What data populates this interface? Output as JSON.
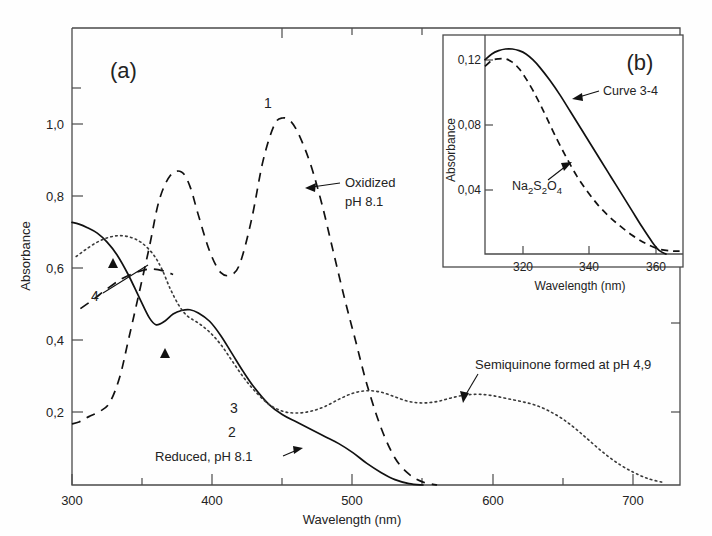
{
  "figure": {
    "panel_a_label": "(a)",
    "panel_b_label": "(b)"
  },
  "panel_a": {
    "xlabel": "Wavelength (nm)",
    "ylabel": "Absorbance",
    "xticks": [
      "300",
      "400",
      "500",
      "600",
      "700"
    ],
    "xtick_values": [
      300,
      400,
      500,
      600,
      700
    ],
    "xminor_values": [
      350,
      450,
      550,
      650
    ],
    "yticks": [
      "0,2",
      "0,4",
      "0,6",
      "0,8",
      "1,0"
    ],
    "ytick_values": [
      0.2,
      0.4,
      0.6,
      0.8,
      1.0
    ],
    "yminor_values": [
      1.1,
      1.2
    ],
    "xlim": [
      300,
      733
    ],
    "ylim": [
      0,
      1.27
    ],
    "annotations": [
      {
        "name": "oxidized",
        "line1": "Oxidized",
        "line2": "pH 8.1"
      },
      {
        "name": "semiquinone",
        "text": "Semiquinone formed at pH 4,9"
      },
      {
        "name": "reduced",
        "text": "Reduced, pH 8.1"
      }
    ],
    "curve_numbers": [
      "1",
      "2",
      "3",
      "4"
    ]
  },
  "panel_b": {
    "xlabel": "Wavelength (nm)",
    "ylabel": "Absorbance",
    "xticks": [
      "320",
      "340",
      "360"
    ],
    "xtick_values": [
      320,
      340,
      360
    ],
    "yticks": [
      "0,04",
      "0,08",
      "0,12"
    ],
    "ytick_values": [
      0.04,
      0.08,
      0.12
    ],
    "xlim": [
      309,
      367
    ],
    "ylim": [
      0,
      0.133
    ],
    "annotations": [
      {
        "name": "curve-3-4",
        "text": "Curve 3-4"
      },
      {
        "name": "dithionite",
        "text": "Na2S2O4",
        "formula_parts": [
          "Na",
          "2",
          "S",
          "2",
          "O",
          "4"
        ]
      }
    ]
  },
  "chart_data": {
    "type": "line",
    "title": "",
    "panels": [
      {
        "id": "a",
        "label": "(a)",
        "xlabel": "Wavelength (nm)",
        "ylabel": "Absorbance",
        "xlim": [
          300,
          733
        ],
        "ylim": [
          0,
          1.27
        ],
        "grid": false,
        "legend": "inline-annotations",
        "series": [
          {
            "name": "1 - Oxidized pH 8.1",
            "style": "dashed",
            "label": "1",
            "annotation": "Oxidized pH 8.1",
            "x": [
              300,
              305,
              312,
              320,
              327,
              334,
              340,
              347,
              355,
              362,
              370,
              378,
              384,
              390,
              398,
              406,
              414,
              420,
              428,
              436,
              444,
              450,
              456,
              462,
              470,
              478,
              486,
              494,
              502,
              510,
              520,
              530,
              540,
              550,
              560
            ],
            "y": [
              0.17,
              0.175,
              0.19,
              0.205,
              0.23,
              0.3,
              0.4,
              0.52,
              0.66,
              0.79,
              0.86,
              0.87,
              0.83,
              0.75,
              0.65,
              0.59,
              0.585,
              0.62,
              0.74,
              0.9,
              1.0,
              1.02,
              1.01,
              0.97,
              0.89,
              0.78,
              0.65,
              0.52,
              0.4,
              0.28,
              0.16,
              0.075,
              0.03,
              0.008,
              0.0
            ]
          },
          {
            "name": "2 - Reduced pH 8.1",
            "style": "solid",
            "label": "2",
            "annotation": "Reduced, pH 8.1",
            "x": [
              300,
              305,
              311,
              318,
              325,
              332,
              340,
              348,
              355,
              360,
              366,
              372,
              378,
              384,
              390,
              398,
              406,
              414,
              422,
              430,
              440,
              450,
              460,
              470,
              480,
              490,
              500,
              510,
              520,
              530,
              540,
              550
            ],
            "y": [
              0.73,
              0.725,
              0.715,
              0.7,
              0.675,
              0.64,
              0.585,
              0.52,
              0.465,
              0.445,
              0.455,
              0.475,
              0.485,
              0.487,
              0.478,
              0.455,
              0.415,
              0.365,
              0.315,
              0.27,
              0.225,
              0.195,
              0.175,
              0.155,
              0.135,
              0.115,
              0.09,
              0.06,
              0.035,
              0.015,
              0.004,
              0.0
            ]
          },
          {
            "name": "3 - Semiquinone formed at pH 4.9",
            "style": "dotted",
            "label": "3",
            "annotation": "Semiquinone formed at pH 4,9",
            "x": [
              303,
              310,
              318,
              326,
              334,
              342,
              350,
              358,
              364,
              370,
              376,
              382,
              390,
              398,
              406,
              414,
              422,
              430,
              440,
              450,
              460,
              470,
              480,
              490,
              500,
              510,
              520,
              530,
              540,
              550,
              560,
              570,
              580,
              590,
              600,
              610,
              620,
              630,
              640,
              650,
              660,
              670,
              680,
              690,
              700,
              710,
              720
            ],
            "y": [
              0.635,
              0.655,
              0.675,
              0.688,
              0.693,
              0.688,
              0.672,
              0.64,
              0.6,
              0.545,
              0.5,
              0.47,
              0.45,
              0.425,
              0.39,
              0.345,
              0.3,
              0.262,
              0.225,
              0.205,
              0.2,
              0.205,
              0.218,
              0.238,
              0.255,
              0.262,
              0.258,
              0.245,
              0.232,
              0.228,
              0.232,
              0.242,
              0.25,
              0.252,
              0.248,
              0.24,
              0.232,
              0.222,
              0.205,
              0.182,
              0.152,
              0.118,
              0.085,
              0.057,
              0.035,
              0.018,
              0.008
            ]
          },
          {
            "name": "4",
            "style": "dashed-short",
            "label": "4",
            "x": [
              306,
              315,
              325,
              335,
              345,
              355,
              365,
              372
            ],
            "y": [
              0.49,
              0.515,
              0.545,
              0.572,
              0.59,
              0.6,
              0.595,
              0.585
            ]
          }
        ]
      },
      {
        "id": "b",
        "label": "(b)",
        "xlabel": "Wavelength (nm)",
        "ylabel": "Absorbance",
        "xlim": [
          309,
          367
        ],
        "ylim": [
          0,
          0.133
        ],
        "grid": false,
        "series": [
          {
            "name": "Curve 3-4",
            "style": "solid",
            "annotation": "Curve 3-4",
            "x": [
              309,
              311,
              313,
              315,
              317,
              319,
              321,
              323,
              325,
              328,
              331,
              334,
              337,
              340,
              343,
              346,
              349,
              352,
              355,
              358,
              360,
              362
            ],
            "y": [
              0.118,
              0.1215,
              0.1235,
              0.1245,
              0.1245,
              0.1235,
              0.1215,
              0.118,
              0.1135,
              0.1055,
              0.0965,
              0.0865,
              0.0765,
              0.0665,
              0.0565,
              0.0465,
              0.0365,
              0.0265,
              0.0165,
              0.0072,
              0.0022,
              0.0
            ]
          },
          {
            "name": "Na2S2O4",
            "style": "dashed",
            "annotation": "Na2S2O4",
            "x": [
              309,
              311,
              313,
              315,
              317,
              319,
              321,
              323,
              325,
              327,
              330,
              333,
              336,
              339,
              342,
              345,
              348,
              352,
              356,
              360,
              364,
              366
            ],
            "y": [
              0.114,
              0.1175,
              0.1185,
              0.1185,
              0.1165,
              0.1125,
              0.1065,
              0.0995,
              0.0915,
              0.083,
              0.07,
              0.058,
              0.047,
              0.038,
              0.03,
              0.0235,
              0.018,
              0.0115,
              0.0065,
              0.003,
              0.0018,
              0.0018
            ]
          }
        ]
      }
    ]
  }
}
